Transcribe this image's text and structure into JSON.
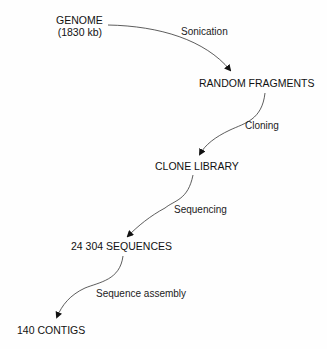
{
  "diagram": {
    "type": "flow",
    "nodes": [
      {
        "id": "genome",
        "line1": "GENOME",
        "line2": "(1830 kb)"
      },
      {
        "id": "random_fragments",
        "label": "RANDOM FRAGMENTS"
      },
      {
        "id": "clone_library",
        "label": "CLONE LIBRARY"
      },
      {
        "id": "sequences",
        "label": "24 304 SEQUENCES"
      },
      {
        "id": "contigs",
        "label": "140 CONTIGS"
      }
    ],
    "edges": [
      {
        "from": "genome",
        "to": "random_fragments",
        "label": "Sonication"
      },
      {
        "from": "random_fragments",
        "to": "clone_library",
        "label": "Cloning"
      },
      {
        "from": "clone_library",
        "to": "sequences",
        "label": "Sequencing"
      },
      {
        "from": "sequences",
        "to": "contigs",
        "label": "Sequence assembly"
      }
    ]
  }
}
